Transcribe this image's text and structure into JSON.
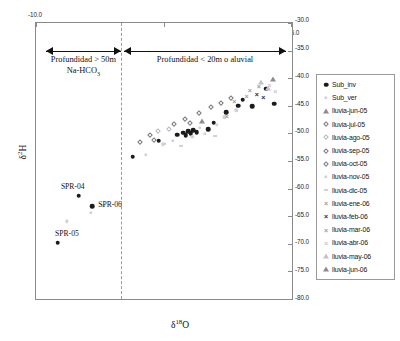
{
  "chart": {
    "type": "scatter",
    "title": "",
    "xlabel": "d18O",
    "ylabel": "d2H",
    "xlabel_parts": {
      "delta": "δ",
      "sup": "18",
      "element": "O"
    },
    "ylabel_parts": {
      "delta": "δ",
      "sup": "2",
      "element": "H"
    },
    "xlim": [
      -10.0,
      -6.0
    ],
    "ylim": [
      -80.0,
      -30.0
    ],
    "grid": false,
    "legend_position": "right-outside",
    "x_axis_position": "top",
    "y_axis_labels_position": "right"
  },
  "axes": {
    "x_ticks": [
      "-10.0",
      "-8.0",
      "-6.0"
    ],
    "x_tick_values": [
      -10.0,
      -8.0,
      -6.0
    ],
    "y_ticks": [
      "-30.0",
      "-35.0",
      "-40.0",
      "-45.0",
      "-50.0",
      "-55.0",
      "-60.0",
      "-65.0",
      "-70.0",
      "-75.0",
      "-80.0"
    ],
    "y_tick_values": [
      -30.0,
      -35.0,
      -40.0,
      -45.0,
      -50.0,
      -55.0,
      -60.0,
      -65.0,
      -70.0,
      -75.0,
      -80.0
    ]
  },
  "annotations": {
    "divider_x": -8.67,
    "left_zone": {
      "line1": "Profundidad > 50m",
      "line2_prefix": "Na-HCO",
      "line2_sub": "3",
      "x_from": -9.85,
      "x_to": -8.67,
      "y": -35.0
    },
    "right_zone": {
      "line1": "Profundidad < 20m o aluvial",
      "x_from": -8.62,
      "x_to": -6.1,
      "y": -35.0
    },
    "sample_labels": [
      {
        "text": "SPR-04",
        "x": -9.33,
        "y": -60.4
      },
      {
        "text": "SPR-06",
        "x": -9.09,
        "y": -62.6
      },
      {
        "text": "SPR-05",
        "x": -9.67,
        "y": -68.9
      }
    ]
  },
  "legend": {
    "items": [
      {
        "label": "Sub_inv",
        "symbol": "filled-circle",
        "tone": "dark"
      },
      {
        "label": "Sub_ver",
        "symbol": "dot-light",
        "tone": "light"
      },
      {
        "label": "lluvia-jun-05",
        "symbol": "open-triangle",
        "tone": "mid"
      },
      {
        "label": "lluvia-jul-05",
        "symbol": "open-diamond",
        "tone": "mid"
      },
      {
        "label": "lluvia-ago-05",
        "symbol": "open-diamond",
        "tone": "light"
      },
      {
        "label": "lluvia-sep-05",
        "symbol": "open-diamond",
        "tone": "mid"
      },
      {
        "label": "lluvia-oct-05",
        "symbol": "open-diamond",
        "tone": "mid"
      },
      {
        "label": "lluvia-nov-05",
        "symbol": "dot-light",
        "tone": "light"
      },
      {
        "label": "lluvia-dic-05",
        "symbol": "dash",
        "tone": "mid"
      },
      {
        "label": "lluvia-ene-06",
        "symbol": "x-mark",
        "tone": "mid"
      },
      {
        "label": "lluvia-feb-06",
        "symbol": "x-mark",
        "tone": "dark"
      },
      {
        "label": "lluvia-mar-06",
        "symbol": "x-mark",
        "tone": "mid"
      },
      {
        "label": "lluvia-abr-06",
        "symbol": "x-mark",
        "tone": "light"
      },
      {
        "label": "lluvia-may-06",
        "symbol": "open-triangle",
        "tone": "light"
      },
      {
        "label": "lluvia-jun-06",
        "symbol": "open-triangle",
        "tone": "mid"
      }
    ]
  },
  "chart_data": {
    "type": "scatter",
    "title": "",
    "xlabel": "δ18O",
    "ylabel": "δ2H",
    "xlim": [
      -10.0,
      -6.0
    ],
    "ylim": [
      -80.0,
      -30.0
    ],
    "grid": false,
    "legend_position": "right-outside",
    "series": [
      {
        "name": "Sub_inv",
        "symbol": "filled-circle",
        "points": [
          [
            -9.33,
            -61.3
          ],
          [
            -9.12,
            -63.2
          ],
          [
            -9.66,
            -69.8
          ],
          [
            -8.49,
            -54.2
          ],
          [
            -8.08,
            -51.3
          ],
          [
            -7.79,
            -50.2
          ],
          [
            -7.7,
            -49.9
          ],
          [
            -7.66,
            -50.3
          ],
          [
            -7.62,
            -49.6
          ],
          [
            -7.58,
            -50.0
          ],
          [
            -7.54,
            -49.4
          ],
          [
            -7.49,
            -49.8
          ],
          [
            -7.31,
            -49.2
          ],
          [
            -7.22,
            -48.1
          ],
          [
            -7.03,
            -46.2
          ],
          [
            -6.84,
            -45.0
          ],
          [
            -6.77,
            -43.9
          ],
          [
            -6.62,
            -45.1
          ],
          [
            -6.4,
            -41.9
          ],
          [
            -6.28,
            -44.6
          ]
        ]
      },
      {
        "name": "Sub_ver",
        "symbol": "dot-light",
        "points": [
          [
            -9.52,
            -65.9
          ],
          [
            -8.95,
            -63.1
          ],
          [
            -8.28,
            -53.9
          ],
          [
            -8.02,
            -52.0
          ],
          [
            -7.86,
            -51.4
          ],
          [
            -7.56,
            -50.6
          ],
          [
            -7.44,
            -49.0
          ],
          [
            -7.18,
            -48.4
          ],
          [
            -7.06,
            -47.1
          ],
          [
            -6.87,
            -45.8
          ]
        ]
      },
      {
        "name": "lluvia-jun-05",
        "symbol": "open-triangle",
        "points": [
          [
            -7.4,
            -47.7
          ]
        ]
      },
      {
        "name": "lluvia-jul-05",
        "symbol": "open-diamond",
        "points": [
          [
            -8.38,
            -51.6
          ],
          [
            -8.22,
            -50.3
          ],
          [
            -8.16,
            -51.1
          ]
        ]
      },
      {
        "name": "lluvia-ago-05",
        "symbol": "open-diamond",
        "points": [
          [
            -8.09,
            -49.5
          ],
          [
            -7.92,
            -49.2
          ]
        ]
      },
      {
        "name": "lluvia-sep-05",
        "symbol": "open-diamond",
        "points": [
          [
            -7.84,
            -48.3
          ],
          [
            -7.68,
            -47.4
          ],
          [
            -7.59,
            -48.1
          ]
        ]
      },
      {
        "name": "lluvia-oct-05",
        "symbol": "open-diamond",
        "points": [
          [
            -7.46,
            -46.3
          ],
          [
            -7.27,
            -45.2
          ],
          [
            -7.11,
            -44.5
          ],
          [
            -6.96,
            -43.6
          ]
        ]
      },
      {
        "name": "lluvia-nov-05",
        "symbol": "dot-light",
        "points": [
          [
            -9.14,
            -64.4
          ],
          [
            -7.99,
            -51.9
          ],
          [
            -7.36,
            -50.1
          ]
        ]
      },
      {
        "name": "lluvia-dic-05",
        "symbol": "dash",
        "points": [
          [
            -7.73,
            -52.2
          ],
          [
            -7.21,
            -50.5
          ]
        ]
      },
      {
        "name": "lluvia-ene-06",
        "symbol": "x-mark",
        "points": [
          [
            -7.02,
            -46.9
          ],
          [
            -6.9,
            -44.1
          ],
          [
            -6.71,
            -43.2
          ]
        ]
      },
      {
        "name": "lluvia-feb-06",
        "symbol": "x-mark",
        "points": [
          [
            -6.55,
            -42.8
          ],
          [
            -6.45,
            -43.4
          ]
        ]
      },
      {
        "name": "lluvia-mar-06",
        "symbol": "x-mark",
        "points": [
          [
            -6.66,
            -42.1
          ],
          [
            -6.52,
            -41.4
          ]
        ]
      },
      {
        "name": "lluvia-abr-06",
        "symbol": "x-mark",
        "points": [
          [
            -6.35,
            -41.2
          ],
          [
            -6.26,
            -42.4
          ]
        ]
      },
      {
        "name": "lluvia-may-06",
        "symbol": "open-triangle",
        "points": [
          [
            -6.48,
            -40.6
          ],
          [
            -6.37,
            -41.8
          ]
        ]
      },
      {
        "name": "lluvia-jun-06",
        "symbol": "open-triangle",
        "points": [
          [
            -6.3,
            -40.2
          ]
        ]
      }
    ],
    "annotations": [
      {
        "text": "Profundidad > 50m",
        "x": -9.3,
        "y": -36.5
      },
      {
        "text": "Na-HCO3",
        "x": -9.3,
        "y": -38.2
      },
      {
        "text": "Profundidad < 20m o aluvial",
        "x": -7.4,
        "y": -36.5
      },
      {
        "text": "SPR-04",
        "x": -9.33,
        "y": -60.4
      },
      {
        "text": "SPR-06",
        "x": -9.09,
        "y": -62.6
      },
      {
        "text": "SPR-05",
        "x": -9.67,
        "y": -68.9
      }
    ]
  }
}
